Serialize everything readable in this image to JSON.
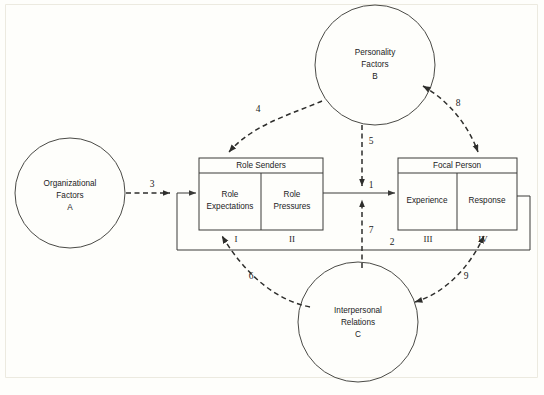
{
  "figure": {
    "background_color": "#fefefb",
    "line_color": "#3a3a38"
  },
  "circles": [
    {
      "id": "A",
      "name": "organizational-factors",
      "line1": "Organizational",
      "line2": "Factors",
      "line3": "A",
      "cx": 70,
      "cy": 193,
      "r": 55
    },
    {
      "id": "B",
      "name": "personality-factors",
      "line1": "Personality",
      "line2": "Factors",
      "line3": "B",
      "cx": 375,
      "cy": 65,
      "r": 60
    },
    {
      "id": "C",
      "name": "interpersonal-relations",
      "line1": "Interpersonal",
      "line2": "Relations",
      "line3": "C",
      "cx": 358,
      "cy": 322,
      "r": 60
    }
  ],
  "boxes": [
    {
      "id": "role-senders",
      "title": "Role Senders",
      "x": 199,
      "y": 158,
      "w": 124,
      "h": 72,
      "header_h": 15,
      "cells": [
        {
          "line1": "Role",
          "line2": "Expectations",
          "roman": "I"
        },
        {
          "line1": "Role",
          "line2": "Pressures",
          "roman": "II"
        }
      ]
    },
    {
      "id": "focal-person",
      "title": "Focal  Person",
      "x": 398,
      "y": 158,
      "w": 119,
      "h": 72,
      "header_h": 15,
      "cells": [
        {
          "line1": "Experience",
          "line2": "",
          "roman": "III"
        },
        {
          "line1": "Response",
          "line2": "",
          "roman": "IV"
        }
      ]
    }
  ],
  "edges": [
    {
      "id": "e3",
      "label": "3",
      "style": "dashed",
      "from": "A",
      "to": "role-senders",
      "lx": 152,
      "ly": 185
    },
    {
      "id": "e4",
      "label": "4",
      "style": "dashed",
      "from": "B",
      "to": "role-senders",
      "lx": 258,
      "ly": 110
    },
    {
      "id": "e5",
      "label": "5",
      "style": "dashed",
      "from": "B",
      "to": "line-1",
      "lx": 369,
      "ly": 142
    },
    {
      "id": "e1",
      "label": "1",
      "style": "solid",
      "from": "role-senders",
      "to": "focal-person",
      "lx": 371,
      "ly": 186
    },
    {
      "id": "e7",
      "label": "7",
      "style": "dashed",
      "from": "C",
      "to": "line-1",
      "lx": 369,
      "ly": 231
    },
    {
      "id": "e8",
      "label": "8",
      "style": "dashed",
      "from": "B",
      "to": "focal-person",
      "lx": 458,
      "ly": 104
    },
    {
      "id": "e2",
      "label": "2",
      "style": "solid",
      "from": "focal-person",
      "to": "role-senders",
      "lx": 392,
      "ly": 243
    },
    {
      "id": "e6",
      "label": "6",
      "style": "dashed",
      "from": "C",
      "to": "role-senders",
      "lx": 251,
      "ly": 277
    },
    {
      "id": "e9",
      "label": "9",
      "style": "dashed",
      "from": "C",
      "to": "focal-person",
      "lx": 466,
      "ly": 277
    }
  ]
}
